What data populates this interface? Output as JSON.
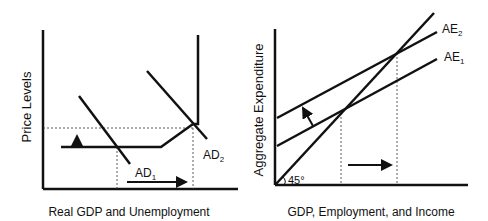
{
  "colors": {
    "line": "#111111",
    "background": "#ffffff"
  },
  "left_panel": {
    "y_axis_label": "Price Levels",
    "x_axis_label": "Real GDP and Unemployment",
    "curves": [
      {
        "id": "AD1",
        "label_main": "AD",
        "label_sub": "1"
      },
      {
        "id": "AD2",
        "label_main": "AD",
        "label_sub": "2"
      },
      {
        "id": "AS",
        "label_main": "",
        "label_sub": ""
      }
    ],
    "arrows": [
      "price-level-up",
      "output-right"
    ]
  },
  "right_panel": {
    "y_axis_label": "Aggregate Expenditure",
    "x_axis_label": "GDP, Employment, and Income",
    "angle_label": "45°",
    "curves": [
      {
        "id": "AE1",
        "label_main": "AE",
        "label_sub": "1"
      },
      {
        "id": "AE2",
        "label_main": "AE",
        "label_sub": "2"
      },
      {
        "id": "45-degree-line",
        "label_main": "",
        "label_sub": ""
      }
    ],
    "arrows": [
      "ae-shift-up",
      "output-right"
    ]
  }
}
